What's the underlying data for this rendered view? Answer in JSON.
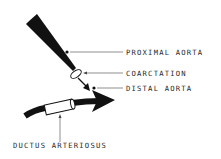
{
  "diagram": {
    "type": "anatomical-schematic",
    "colors": {
      "ink": "#111111",
      "background": "#ffffff",
      "label": "#2a2a2a"
    },
    "labels": {
      "proximal_aorta": "PROXIMAL  AORTA",
      "coarctation": "COARCTATION",
      "distal_aorta": "DISTAL  AORTA",
      "ductus_arteriosus": "DUCTUS  ARTERIOSUS"
    },
    "nodes": [
      {
        "id": "proximal_aorta",
        "label": "PROXIMAL  AORTA",
        "marker": "dot"
      },
      {
        "id": "coarctation",
        "label": "COARCTATION",
        "marker": "ring"
      },
      {
        "id": "distal_aorta",
        "label": "DISTAL  AORTA",
        "marker": "dot"
      },
      {
        "id": "ductus_arteriosus",
        "label": "DUCTUS  ARTERIOSUS",
        "marker": "cylinder"
      }
    ]
  }
}
